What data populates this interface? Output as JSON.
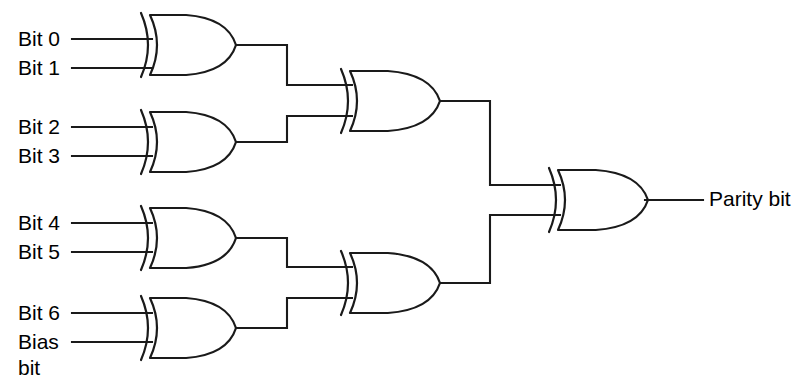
{
  "diagram": {
    "stroke_color": "#1a1a1a",
    "background_color": "#ffffff",
    "text_color": "#000000",
    "inputs": [
      {
        "id": "bit0",
        "label": "Bit 0",
        "label_x": 18,
        "label_y": 40,
        "wire_y": 39
      },
      {
        "id": "bit1",
        "label": "Bit 1",
        "label_x": 18,
        "label_y": 69,
        "wire_y": 68
      },
      {
        "id": "bit2",
        "label": "Bit 2",
        "label_x": 18,
        "label_y": 128,
        "wire_y": 127
      },
      {
        "id": "bit3",
        "label": "Bit 3",
        "label_x": 18,
        "label_y": 157,
        "wire_y": 156
      },
      {
        "id": "bit4",
        "label": "Bit 4",
        "label_x": 18,
        "label_y": 224,
        "wire_y": 223
      },
      {
        "id": "bit5",
        "label": "Bit 5",
        "label_x": 18,
        "label_y": 253,
        "wire_y": 252
      },
      {
        "id": "bit6",
        "label": "Bit 6",
        "label_x": 18,
        "label_y": 314,
        "wire_y": 313
      },
      {
        "id": "biasbit",
        "label": "Bias",
        "label_x": 18,
        "label_y": 343,
        "wire_y": 342
      }
    ],
    "bias_second_line": {
      "label": "bit",
      "label_x": 18,
      "label_y": 369
    },
    "output": {
      "id": "parity",
      "label": "Parity bit",
      "label_x": 709,
      "label_y": 200,
      "wire_y": 200,
      "wire_x1": 645,
      "wire_x2": 703
    },
    "gates": [
      {
        "id": "xor1",
        "name": "xor-gate-1",
        "x": 150,
        "y": 15,
        "w": 86,
        "h": 60,
        "type": "XOR"
      },
      {
        "id": "xor2",
        "name": "xor-gate-2",
        "x": 150,
        "y": 112,
        "w": 86,
        "h": 60,
        "type": "XOR"
      },
      {
        "id": "xor3",
        "name": "xor-gate-3",
        "x": 150,
        "y": 208,
        "w": 86,
        "h": 60,
        "type": "XOR"
      },
      {
        "id": "xor4",
        "name": "xor-gate-4",
        "x": 150,
        "y": 298,
        "w": 86,
        "h": 60,
        "type": "XOR"
      },
      {
        "id": "xor5",
        "name": "xor-gate-5",
        "x": 350,
        "y": 71,
        "w": 90,
        "h": 60,
        "type": "XOR"
      },
      {
        "id": "xor6",
        "name": "xor-gate-6",
        "x": 350,
        "y": 253,
        "w": 90,
        "h": 60,
        "type": "XOR"
      },
      {
        "id": "xor7",
        "name": "xor-gate-7",
        "x": 558,
        "y": 170,
        "w": 90,
        "h": 60,
        "type": "XOR"
      }
    ],
    "input_wires": [
      {
        "name": "wire-bit0",
        "d": "M 72 39 L 152 39"
      },
      {
        "name": "wire-bit1",
        "d": "M 72 68 L 152 68"
      },
      {
        "name": "wire-bit2",
        "d": "M 72 127 L 152 127"
      },
      {
        "name": "wire-bit3",
        "d": "M 72 156 L 152 156"
      },
      {
        "name": "wire-bit4",
        "d": "M 72 223 L 152 223"
      },
      {
        "name": "wire-bit5",
        "d": "M 72 252 L 152 252"
      },
      {
        "name": "wire-bit6",
        "d": "M 72 313 L 152 313"
      },
      {
        "name": "wire-bias",
        "d": "M 72 342 L 152 342"
      }
    ],
    "link_wires": [
      {
        "name": "wire-xor1-to-xor5",
        "d": "M 236 45 L 287 45 L 287 85 L 352 85"
      },
      {
        "name": "wire-xor2-to-xor5",
        "d": "M 236 142 L 287 142 L 287 116 L 352 116"
      },
      {
        "name": "wire-xor3-to-xor6",
        "d": "M 236 238 L 287 238 L 287 267 L 352 267"
      },
      {
        "name": "wire-xor4-to-xor6",
        "d": "M 236 328 L 287 328 L 287 298 L 352 298"
      },
      {
        "name": "wire-xor5-to-xor7",
        "d": "M 440 101 L 490 101 L 490 185 L 560 185"
      },
      {
        "name": "wire-xor6-to-xor7",
        "d": "M 440 283 L 490 283 L 490 215 L 560 215"
      }
    ]
  }
}
